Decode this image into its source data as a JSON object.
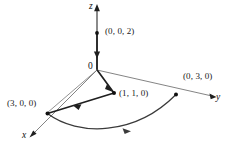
{
  "figure": {
    "kind": "3d-coordinate-axes-diagram",
    "background_color": "#ffffff",
    "line_color": "#1f1f1f",
    "helper_line_color": "#777777",
    "axes": [
      {
        "name": "x",
        "label": "x",
        "direction": "down-left",
        "arrow": true
      },
      {
        "name": "y",
        "label": "y",
        "direction": "right",
        "arrow": true
      },
      {
        "name": "z",
        "label": "z",
        "direction": "up",
        "arrow": true
      }
    ],
    "origin_label": "0",
    "points": [
      {
        "id": "p002",
        "label": "(0, 0, 2)",
        "coords": [
          0,
          0,
          2
        ],
        "on_axis": "z"
      },
      {
        "id": "p030",
        "label": "(0, 3, 0)",
        "coords": [
          0,
          3,
          0
        ],
        "on_axis": "y"
      },
      {
        "id": "p300",
        "label": "(3, 0, 0)",
        "coords": [
          3,
          0,
          0
        ],
        "on_axis": "x"
      },
      {
        "id": "p110",
        "label": "(1, 1, 0)",
        "coords": [
          1,
          1,
          0
        ],
        "on_axis": "none"
      }
    ],
    "path_segments": [
      {
        "id": "seg-z-down",
        "from": "(0, 0, 2)",
        "to": "0",
        "style": "directed-straight",
        "arrow_direction": "down"
      },
      {
        "id": "seg-origin-to-110",
        "from": "0",
        "to": "(1, 1, 0)",
        "style": "directed-straight",
        "arrow_direction": "down-right"
      },
      {
        "id": "seg-110-to-300",
        "from": "(1, 1, 0)",
        "to": "(3, 0, 0)",
        "style": "directed-straight",
        "arrow_direction": "down-left"
      },
      {
        "id": "arc-300-to-030",
        "from": "(3, 0, 0)",
        "to": "(0, 3, 0)",
        "style": "directed-arc",
        "arrow_direction": "right"
      }
    ],
    "helper_segments": [
      {
        "id": "helper-origin-to-300",
        "from": "0",
        "to": "(3, 0, 0)"
      },
      {
        "id": "helper-origin-to-030",
        "from": "0",
        "to": "(0, 3, 0)"
      }
    ]
  }
}
